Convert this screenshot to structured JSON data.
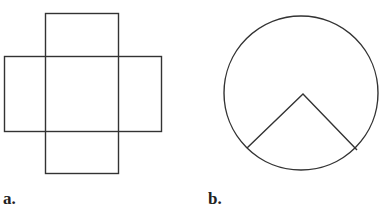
{
  "figures": [
    {
      "label": "a.",
      "description": "Cross-shaped net of five squares (plus shape)",
      "shape": "cross"
    },
    {
      "label": "b.",
      "description": "Circle with a sector (wedge) outlined from center to lower circumference",
      "shape": "circle-with-sector"
    }
  ],
  "colors": {
    "stroke": "#333333",
    "background": "#ffffff",
    "label": "#222222"
  }
}
